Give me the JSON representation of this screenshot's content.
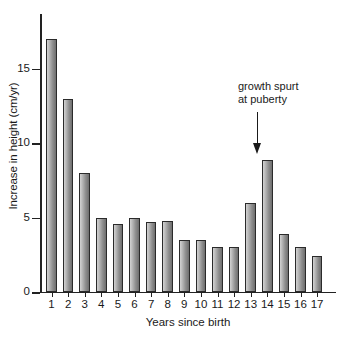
{
  "chart_data": {
    "type": "bar",
    "title": "",
    "subtitle": "",
    "xlabel": "Years since birth",
    "ylabel": "Increase in height (cm/yr)",
    "categories": [
      "1",
      "2",
      "3",
      "4",
      "5",
      "6",
      "7",
      "8",
      "9",
      "10",
      "11",
      "12",
      "13",
      "14",
      "15",
      "16",
      "17"
    ],
    "values": [
      17.0,
      13.0,
      8.0,
      5.0,
      4.6,
      5.0,
      4.7,
      4.8,
      3.5,
      3.5,
      3.0,
      3.0,
      6.0,
      8.9,
      3.9,
      3.0,
      2.4
    ],
    "ylim": [
      0,
      17.8
    ],
    "yticks": [
      0,
      5,
      10,
      15
    ],
    "ytick_labels": [
      "0",
      "5",
      "10",
      "15"
    ],
    "grid": false,
    "legend": null,
    "legend_position": "none",
    "bar_color_light": "#d2d2d2",
    "bar_color_dark": "#6e6e6e",
    "bar_outline_color": "#2b2b2b",
    "axis_color": "#222222",
    "background_color": "#ffffff",
    "annotations": [
      {
        "text_line_1": "growth spurt",
        "text_line_2": "at puberty",
        "arrow": "down-arrow",
        "points_at_category": "13"
      }
    ]
  },
  "annotation": {
    "line1": "growth spurt",
    "line2": "at puberty"
  }
}
